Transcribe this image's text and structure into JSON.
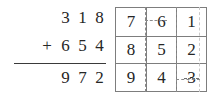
{
  "addition": {
    "addend1": {
      "digits": [
        "3",
        "1",
        "8"
      ],
      "value": "318"
    },
    "addend2": {
      "operator": "+",
      "digits": [
        "6",
        "5",
        "4"
      ],
      "value": "654"
    },
    "sum": {
      "digits": [
        "9",
        "7",
        "2"
      ],
      "value": "972"
    },
    "rule_color": "#3a3a3a"
  },
  "grid": {
    "rows": [
      [
        "7",
        "6",
        "1"
      ],
      [
        "8",
        "5",
        "2"
      ],
      [
        "9",
        "4",
        "3"
      ]
    ],
    "border_color": "#7d7d7d",
    "dotted_color": "#8a8a8a",
    "faint_dotted_color": "#c9c9c9",
    "struck_cell": "3"
  },
  "colors": {
    "background": "#ffffff",
    "text": "#262626"
  }
}
